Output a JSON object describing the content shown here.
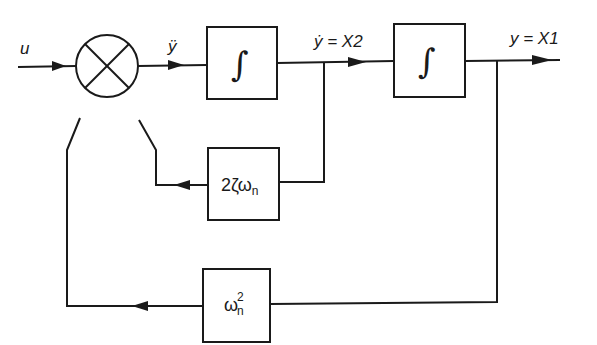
{
  "diagram": {
    "type": "block-diagram",
    "signals": {
      "input": "u",
      "summer_output": "ÿ",
      "state2": "ẏ = X2",
      "state1": "y = X1"
    },
    "blocks": {
      "integrator1": {
        "symbol": "∫"
      },
      "integrator2": {
        "symbol": "∫"
      },
      "damping_gain": {
        "text": "2ζω",
        "subscript": "n"
      },
      "stiffness_gain": {
        "text": "ω",
        "superscript": "2",
        "subscript": "n"
      }
    },
    "summing_junction": {
      "symbol": "⊗",
      "inputs": [
        "u",
        "2ζωn feedback",
        "ωn² feedback"
      ]
    },
    "colors": {
      "line": "#1a1a1a",
      "background": "#ffffff"
    }
  }
}
